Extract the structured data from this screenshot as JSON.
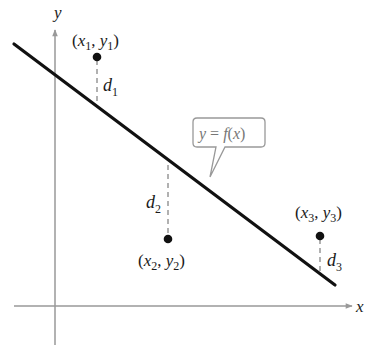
{
  "diagram": {
    "axes": {
      "x_label": "x",
      "y_label": "y",
      "color": "#999999"
    },
    "line": {
      "label": "y = f(x)",
      "label_parts": {
        "y": "y",
        "eq": " = ",
        "f": "f",
        "paren_open": "(",
        "x": "x",
        "paren_close": ")"
      },
      "color": "#111111"
    },
    "points": [
      {
        "id": 1,
        "label_open": "(",
        "x": "x",
        "x_sub": "1",
        "comma": ", ",
        "y": "y",
        "y_sub": "1",
        "label_close": ")",
        "distance_label": "d",
        "distance_sub": "1"
      },
      {
        "id": 2,
        "label_open": "(",
        "x": "x",
        "x_sub": "2",
        "comma": ", ",
        "y": "y",
        "y_sub": "2",
        "label_close": ")",
        "distance_label": "d",
        "distance_sub": "2"
      },
      {
        "id": 3,
        "label_open": "(",
        "x": "x",
        "x_sub": "3",
        "comma": ", ",
        "y": "y",
        "y_sub": "3",
        "label_close": ")",
        "distance_label": "d",
        "distance_sub": "3"
      }
    ],
    "colors": {
      "point": "#111111",
      "dashed": "#888888",
      "callout_border": "#999999",
      "callout_text": "#777777"
    }
  }
}
